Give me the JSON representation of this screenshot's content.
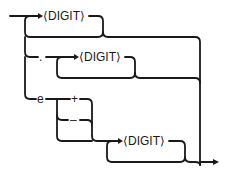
{
  "diagram": {
    "type": "syntax-railroad",
    "nodes": [
      {
        "id": "digit1",
        "label": "⟨DIGIT⟩",
        "repeatable": true
      },
      {
        "id": "dot",
        "label": "."
      },
      {
        "id": "digit2",
        "label": "⟨DIGIT⟩",
        "repeatable": true
      },
      {
        "id": "e",
        "label": "e"
      },
      {
        "id": "plus",
        "label": "+"
      },
      {
        "id": "minus",
        "label": "–"
      },
      {
        "id": "digit3",
        "label": "⟨DIGIT⟩",
        "repeatable": true
      }
    ],
    "colors": {
      "line": "#1a1a1a",
      "background": "#ffffff"
    }
  }
}
